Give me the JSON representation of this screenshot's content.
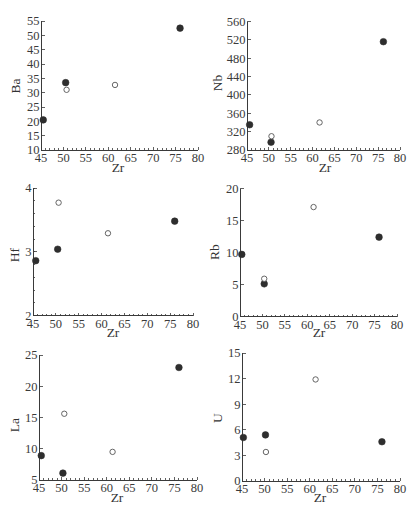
{
  "figure": {
    "panel_count": 6
  },
  "chart_data": [
    {
      "type": "scatter",
      "title": "",
      "xlabel": "Zr",
      "ylabel": "Ba",
      "xlim": [
        45,
        80
      ],
      "ylim": [
        10,
        55
      ],
      "xticks": [
        "45",
        "50",
        "55",
        "60",
        "65",
        "70",
        "75",
        "80"
      ],
      "yticks": [
        "10",
        "15",
        "20",
        "25",
        "30",
        "35",
        "40",
        "45",
        "50",
        "55"
      ],
      "x_minor_step": 1,
      "y_minor_step": null,
      "grid": false,
      "legend": null,
      "series": [
        {
          "name": "",
          "marker": "filled-circle",
          "x": [
            45.5,
            50.5,
            76.0
          ],
          "y": [
            20.5,
            33.5,
            52.5
          ]
        },
        {
          "name": "",
          "marker": "open-circle",
          "x": [
            50.7,
            61.5
          ],
          "y": [
            31.0,
            32.7
          ]
        }
      ]
    },
    {
      "type": "scatter",
      "title": "",
      "xlabel": "Zr",
      "ylabel": "Nb",
      "xlim": [
        45,
        80
      ],
      "ylim": [
        280,
        560
      ],
      "xticks": [
        "45",
        "50",
        "55",
        "60",
        "65",
        "70",
        "75",
        "80"
      ],
      "yticks": [
        "280",
        "320",
        "360",
        "400",
        "440",
        "480",
        "520",
        "560"
      ],
      "x_minor_step": 1,
      "y_minor_step": null,
      "grid": false,
      "legend": null,
      "series": [
        {
          "name": "",
          "marker": "filled-circle",
          "x": [
            45.6,
            50.5,
            76.2
          ],
          "y": [
            335,
            297,
            516
          ]
        },
        {
          "name": "",
          "marker": "open-circle",
          "x": [
            50.6,
            61.6
          ],
          "y": [
            310,
            340
          ]
        }
      ]
    },
    {
      "type": "scatter",
      "title": "",
      "xlabel": "Zr",
      "ylabel": "Hf",
      "xlim": [
        45,
        80
      ],
      "ylim": [
        2,
        4
      ],
      "xticks": [
        "45",
        "50",
        "55",
        "60",
        "65",
        "70",
        "75",
        "80"
      ],
      "yticks": [
        "2",
        "3",
        "4"
      ],
      "x_minor_step": 1,
      "y_minor_step": 0.2,
      "grid": false,
      "legend": null,
      "series": [
        {
          "name": "",
          "marker": "filled-circle",
          "x": [
            45.6,
            50.4,
            76.0
          ],
          "y": [
            2.86,
            3.04,
            3.48
          ]
        },
        {
          "name": "",
          "marker": "open-circle",
          "x": [
            50.6,
            61.4
          ],
          "y": [
            3.77,
            3.29
          ]
        }
      ]
    },
    {
      "type": "scatter",
      "title": "",
      "xlabel": "Zr",
      "ylabel": "Rb",
      "xlim": [
        45,
        80
      ],
      "ylim": [
        0,
        20
      ],
      "xticks": [
        "45",
        "50",
        "55",
        "60",
        "65",
        "70",
        "75",
        "80"
      ],
      "yticks": [
        "0",
        "5",
        "10",
        "15",
        "20"
      ],
      "x_minor_step": 1,
      "y_minor_step": null,
      "grid": false,
      "legend": null,
      "series": [
        {
          "name": "",
          "marker": "filled-circle",
          "x": [
            45.4,
            50.4,
            76.0
          ],
          "y": [
            9.7,
            5.1,
            12.4
          ]
        },
        {
          "name": "",
          "marker": "open-circle",
          "x": [
            50.4,
            61.4
          ],
          "y": [
            5.9,
            17.1
          ]
        }
      ]
    },
    {
      "type": "scatter",
      "title": "",
      "xlabel": "Zr",
      "ylabel": "La",
      "xlim": [
        45,
        80
      ],
      "ylim": [
        5,
        25
      ],
      "xticks": [
        "45",
        "50",
        "55",
        "60",
        "65",
        "70",
        "75",
        "80"
      ],
      "yticks": [
        "5",
        "10",
        "15",
        "20",
        "25"
      ],
      "x_minor_step": 1,
      "y_minor_step": null,
      "grid": false,
      "legend": null,
      "series": [
        {
          "name": "",
          "marker": "filled-circle",
          "x": [
            45.5,
            50.3,
            76.0
          ],
          "y": [
            8.9,
            6.1,
            23.0
          ]
        },
        {
          "name": "",
          "marker": "open-circle",
          "x": [
            50.6,
            61.3
          ],
          "y": [
            15.6,
            9.5
          ]
        }
      ]
    },
    {
      "type": "scatter",
      "title": "",
      "xlabel": "Zr",
      "ylabel": "U",
      "xlim": [
        45,
        80
      ],
      "ylim": [
        0,
        15
      ],
      "xticks": [
        "45",
        "50",
        "55",
        "60",
        "65",
        "70",
        "75",
        "80"
      ],
      "yticks": [
        "0",
        "3",
        "6",
        "9",
        "12",
        "15"
      ],
      "x_minor_step": 1,
      "y_minor_step": null,
      "grid": false,
      "legend": null,
      "series": [
        {
          "name": "",
          "marker": "filled-circle",
          "x": [
            45.3,
            50.2,
            76.0
          ],
          "y": [
            5.1,
            5.4,
            4.6
          ]
        },
        {
          "name": "",
          "marker": "open-circle",
          "x": [
            50.3,
            61.3
          ],
          "y": [
            3.4,
            11.9
          ]
        }
      ]
    }
  ]
}
